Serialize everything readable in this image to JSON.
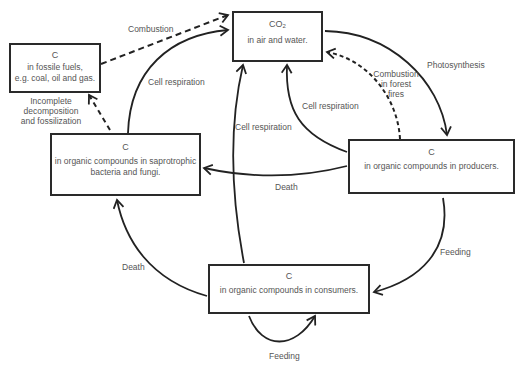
{
  "diagram": {
    "nodes": {
      "co2": {
        "title": "CO",
        "title_sub": "2",
        "desc": "in air and water."
      },
      "fossil": {
        "title": "C",
        "desc_line1": "in fossile fuels,",
        "desc_line2": "e.g. coal, oil and gas."
      },
      "saprotrophs": {
        "title": "C",
        "desc_line1": "in organic compounds in saprotrophic",
        "desc_line2": "bacteria and fungi."
      },
      "producers": {
        "title": "C",
        "desc": "in organic compounds in producers."
      },
      "consumers": {
        "title": "C",
        "desc": "in organic compounds in consumers."
      }
    },
    "edges": {
      "combustion": "Combustion",
      "cell_resp_sapro": "Cell respiration",
      "incomplete_line1": "Incomplete",
      "incomplete_line2": "decomposition",
      "incomplete_line3": "and fossilization",
      "photosynthesis": "Photosynthesis",
      "forest_fire_line1": "Combustion",
      "forest_fire_line2": "in forest",
      "forest_fire_line3": "fires",
      "cell_resp_producers": "Cell respiration",
      "cell_resp_consumers": "Cell respiration",
      "death_producers": "Death",
      "death_consumers": "Death",
      "feeding_producers": "Feeding",
      "feeding_consumers": "Feeding"
    }
  }
}
